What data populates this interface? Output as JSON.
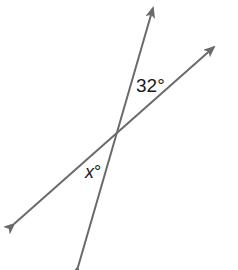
{
  "diagram": {
    "type": "intersecting-lines",
    "line_color": "#6a6a6a",
    "intersection": {
      "x": 115,
      "y": 134
    },
    "lines": [
      {
        "name": "steep-line",
        "from": {
          "x": 78,
          "y": 267
        },
        "to": {
          "x": 153,
          "y": 8
        },
        "arrows": "both"
      },
      {
        "name": "shallow-line",
        "from": {
          "x": 14,
          "y": 224
        },
        "to": {
          "x": 214,
          "y": 47
        },
        "arrows": "both"
      }
    ],
    "labels": {
      "known_angle": {
        "value": "32",
        "unit": "°",
        "text": "32°"
      },
      "unknown_angle": {
        "variable": "x",
        "unit": "°"
      }
    },
    "relationship": "vertical angles"
  }
}
